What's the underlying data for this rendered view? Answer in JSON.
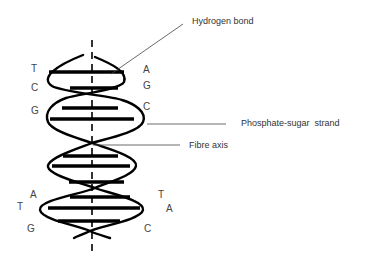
{
  "diagram": {
    "colors": {
      "stroke": "#000000",
      "text": "#333333",
      "leader": "#444444",
      "background": "#ffffff"
    },
    "callouts": {
      "hydrogen_bond": "Hydrogen bond",
      "phosphate_sugar_strand": "Phosphate-sugar  strand",
      "fibre_axis": "Fibre axis"
    },
    "bases_left": [
      "T",
      "C",
      "G",
      "A",
      "T",
      "G"
    ],
    "bases_right": [
      "A",
      "G",
      "C",
      "T",
      "A",
      "C"
    ],
    "base_pairs": [
      {
        "left": "T",
        "right": "A"
      },
      {
        "left": "C",
        "right": "G"
      },
      {
        "left": "G",
        "right": "C"
      },
      {
        "left": "A",
        "right": "T"
      },
      {
        "left": "T",
        "right": "A"
      },
      {
        "left": "G",
        "right": "C"
      }
    ]
  }
}
